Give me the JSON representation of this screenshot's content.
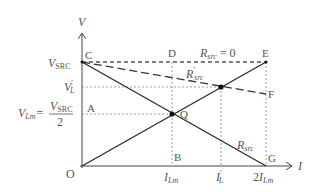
{
  "diagram": {
    "axes": {
      "y_label": "V",
      "x_label": "I",
      "origin_label": "O"
    },
    "points": {
      "C": "C",
      "D": "D",
      "E": "E",
      "F": "F",
      "A": "A",
      "B": "B",
      "G": "G",
      "Q": "Q"
    },
    "y_ticks": {
      "v_src": {
        "main": "V",
        "sub": "SRC"
      },
      "v_l_prime": {
        "main": "V",
        "prime": "′",
        "sub": "L"
      },
      "v_lm": {
        "main": "V",
        "sub": "Lm",
        "eq": "=",
        "num_main": "V",
        "num_sub": "SRC",
        "den": "2"
      }
    },
    "x_ticks": {
      "i_lm": {
        "main": "I",
        "sub": "Lm"
      },
      "i_l_prime": {
        "main": "I",
        "prime": "′",
        "sub": "L"
      },
      "two_i_lm": {
        "coef": "2",
        "main": "I",
        "sub": "Lm"
      }
    },
    "line_labels": {
      "r_src_zero": {
        "main": "R",
        "sub": "src",
        "rest": " = 0"
      },
      "r_src_prime": {
        "main": "R",
        "prime": "′",
        "sub": "src"
      },
      "r_src": {
        "main": "R",
        "sub": "src"
      }
    },
    "colors": {
      "line": "#2a2a2a",
      "dashed": "#666666",
      "text": "#555555"
    }
  }
}
